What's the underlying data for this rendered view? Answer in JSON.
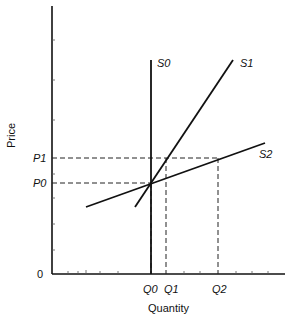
{
  "diagram": {
    "type": "supply-curves",
    "axes": {
      "x_label": "Quantity",
      "y_label": "Price",
      "origin_label": "0"
    },
    "price_labels": {
      "p1": "P1",
      "p0": "P0"
    },
    "quantity_labels": {
      "q0": "Q0",
      "q1": "Q1",
      "q2": "Q2"
    },
    "curves": {
      "s0": "S0",
      "s1": "S1",
      "s2": "S2"
    },
    "colors": {
      "line": "#111111",
      "background": "#ffffff"
    }
  }
}
